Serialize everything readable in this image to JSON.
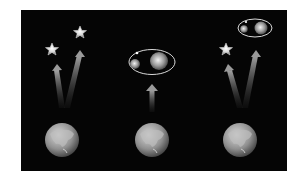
{
  "diagram": {
    "background_color": "#050505",
    "panels": [
      {
        "id": "left",
        "objects": [
          {
            "type": "star",
            "cx": 52,
            "cy": 49
          },
          {
            "type": "star",
            "cx": 80,
            "cy": 32
          },
          {
            "type": "arrow",
            "from": [
              62,
              108
            ],
            "to": [
              56,
              66
            ]
          },
          {
            "type": "arrow",
            "from": [
              67,
              108
            ],
            "to": [
              80,
              52
            ]
          },
          {
            "type": "earth",
            "cx": 62,
            "cy": 140,
            "r": 17
          }
        ]
      },
      {
        "id": "middle",
        "objects": [
          {
            "type": "binary-system",
            "cx": 152,
            "cy": 62,
            "rx": 23,
            "ry": 12,
            "small_star": [
              135,
              64
            ],
            "large_star": [
              159,
              61
            ]
          },
          {
            "type": "arrow",
            "from": [
              152,
              112
            ],
            "to": [
              152,
              85
            ]
          },
          {
            "type": "earth",
            "cx": 152,
            "cy": 140,
            "r": 17
          }
        ]
      },
      {
        "id": "right",
        "objects": [
          {
            "type": "star",
            "cx": 226,
            "cy": 49
          },
          {
            "type": "binary-system",
            "cx": 255,
            "cy": 28,
            "rx": 17,
            "ry": 9,
            "small_star": [
              243,
              29
            ],
            "large_star": [
              261,
              28
            ]
          },
          {
            "type": "arrow",
            "from": [
              240,
              108
            ],
            "to": [
              228,
              66
            ]
          },
          {
            "type": "arrow",
            "from": [
              244,
              108
            ],
            "to": [
              255,
              52
            ]
          },
          {
            "type": "earth",
            "cx": 240,
            "cy": 140,
            "r": 17
          }
        ]
      }
    ]
  }
}
